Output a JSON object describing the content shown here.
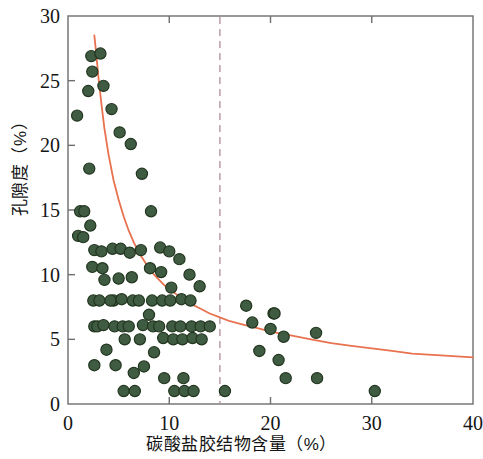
{
  "chart_data": {
    "type": "scatter",
    "title": "",
    "xlabel": "碳酸盐胶结物含量（%）",
    "ylabel": "孔隙度（%）",
    "xlim": [
      0,
      40
    ],
    "ylim": [
      0,
      30
    ],
    "xticks": [
      0,
      10,
      20,
      30,
      40
    ],
    "yticks": [
      0,
      5,
      10,
      15,
      20,
      25,
      30
    ],
    "xtick_labels": [
      "0",
      "10",
      "20",
      "30",
      "40"
    ],
    "ytick_labels": [
      "0",
      "5",
      "10",
      "15",
      "20",
      "25",
      "30"
    ],
    "grid": false,
    "legend": null,
    "marker_color": "#3f5c42",
    "marker_edge_color": "#22351f",
    "marker_size": 9,
    "series": [
      {
        "name": "样品点",
        "type": "scatter",
        "points": [
          [
            0.9,
            22.3
          ],
          [
            1.0,
            13.0
          ],
          [
            1.2,
            14.9
          ],
          [
            1.5,
            12.9
          ],
          [
            2.3,
            26.9
          ],
          [
            2.4,
            25.7
          ],
          [
            2.0,
            24.2
          ],
          [
            1.6,
            14.9
          ],
          [
            2.2,
            13.8
          ],
          [
            2.1,
            18.2
          ],
          [
            2.6,
            11.9
          ],
          [
            2.4,
            10.6
          ],
          [
            2.5,
            8.0
          ],
          [
            2.6,
            6.0
          ],
          [
            2.9,
            6.0
          ],
          [
            2.6,
            3.0
          ],
          [
            3.2,
            27.1
          ],
          [
            3.5,
            24.6
          ],
          [
            3.3,
            11.8
          ],
          [
            3.4,
            10.5
          ],
          [
            3.6,
            9.6
          ],
          [
            3.5,
            6.1
          ],
          [
            3.8,
            4.2
          ],
          [
            3.1,
            8.0
          ],
          [
            4.3,
            22.8
          ],
          [
            4.4,
            12.0
          ],
          [
            4.5,
            8.0
          ],
          [
            4.6,
            6.0
          ],
          [
            4.2,
            8.0
          ],
          [
            4.7,
            3.0
          ],
          [
            5.1,
            21.0
          ],
          [
            5.2,
            12.0
          ],
          [
            5.0,
            9.7
          ],
          [
            5.3,
            8.1
          ],
          [
            5.4,
            6.0
          ],
          [
            5.6,
            5.0
          ],
          [
            5.5,
            1.0
          ],
          [
            6.2,
            20.1
          ],
          [
            6.1,
            11.7
          ],
          [
            6.3,
            9.8
          ],
          [
            6.4,
            8.0
          ],
          [
            6.0,
            6.0
          ],
          [
            6.5,
            2.4
          ],
          [
            6.6,
            1.0
          ],
          [
            7.3,
            17.8
          ],
          [
            7.2,
            11.9
          ],
          [
            7.0,
            8.0
          ],
          [
            7.4,
            6.1
          ],
          [
            7.1,
            5.0
          ],
          [
            7.5,
            2.9
          ],
          [
            8.2,
            14.9
          ],
          [
            8.1,
            10.5
          ],
          [
            8.3,
            8.0
          ],
          [
            8.0,
            6.9
          ],
          [
            8.4,
            6.0
          ],
          [
            8.5,
            4.0
          ],
          [
            9.1,
            12.1
          ],
          [
            9.2,
            10.2
          ],
          [
            9.3,
            8.0
          ],
          [
            9.0,
            6.0
          ],
          [
            9.4,
            5.1
          ],
          [
            9.5,
            2.0
          ],
          [
            10.0,
            11.8
          ],
          [
            10.2,
            9.0
          ],
          [
            10.1,
            8.0
          ],
          [
            10.3,
            6.0
          ],
          [
            10.4,
            5.0
          ],
          [
            10.5,
            1.0
          ],
          [
            11.0,
            11.2
          ],
          [
            11.2,
            8.1
          ],
          [
            11.1,
            6.0
          ],
          [
            11.3,
            5.0
          ],
          [
            11.4,
            2.0
          ],
          [
            11.5,
            1.0
          ],
          [
            12.0,
            10.0
          ],
          [
            12.1,
            8.0
          ],
          [
            12.2,
            6.0
          ],
          [
            12.3,
            5.1
          ],
          [
            12.4,
            1.0
          ],
          [
            13.0,
            9.1
          ],
          [
            13.1,
            6.0
          ],
          [
            13.2,
            5.0
          ],
          [
            14.0,
            6.0
          ],
          [
            15.5,
            1.0
          ],
          [
            17.6,
            7.6
          ],
          [
            18.2,
            6.3
          ],
          [
            18.9,
            4.1
          ],
          [
            20.0,
            5.8
          ],
          [
            20.3,
            7.0
          ],
          [
            20.4,
            7.0
          ],
          [
            20.8,
            3.4
          ],
          [
            21.3,
            5.2
          ],
          [
            21.5,
            2.0
          ],
          [
            24.5,
            5.5
          ],
          [
            24.6,
            2.0
          ],
          [
            30.3,
            1.0
          ]
        ]
      }
    ],
    "fit_curve": {
      "name": "拟合曲线",
      "type": "power_decay",
      "color": "#e8724f",
      "linewidth": 1.8,
      "points": [
        [
          2.6,
          28.5
        ],
        [
          2.8,
          27.0
        ],
        [
          3.0,
          25.3
        ],
        [
          3.3,
          23.2
        ],
        [
          3.6,
          21.3
        ],
        [
          4.0,
          19.3
        ],
        [
          4.5,
          17.3
        ],
        [
          5.0,
          15.8
        ],
        [
          5.5,
          14.5
        ],
        [
          6.0,
          13.4
        ],
        [
          6.5,
          12.5
        ],
        [
          7.0,
          11.7
        ],
        [
          7.5,
          11.1
        ],
        [
          8.0,
          10.5
        ],
        [
          8.5,
          10.0
        ],
        [
          9.0,
          9.6
        ],
        [
          9.5,
          9.2
        ],
        [
          10.0,
          8.9
        ],
        [
          11.0,
          8.3
        ],
        [
          12.0,
          7.8
        ],
        [
          13.0,
          7.4
        ],
        [
          14.0,
          7.0
        ],
        [
          15.0,
          6.7
        ],
        [
          16.0,
          6.4
        ],
        [
          17.0,
          6.2
        ],
        [
          18.0,
          6.0
        ],
        [
          19.0,
          5.8
        ],
        [
          20.0,
          5.6
        ],
        [
          22.0,
          5.3
        ],
        [
          24.0,
          5.0
        ],
        [
          26.0,
          4.7
        ],
        [
          28.0,
          4.5
        ],
        [
          30.0,
          4.3
        ],
        [
          32.0,
          4.1
        ],
        [
          34.0,
          3.9
        ],
        [
          36.0,
          3.8
        ],
        [
          38.0,
          3.7
        ],
        [
          40.0,
          3.6
        ]
      ]
    },
    "reference_line": {
      "name": "临界含量参考线",
      "orientation": "vertical",
      "value": 15,
      "color": "#c0a2ae",
      "style": "dashed"
    }
  }
}
